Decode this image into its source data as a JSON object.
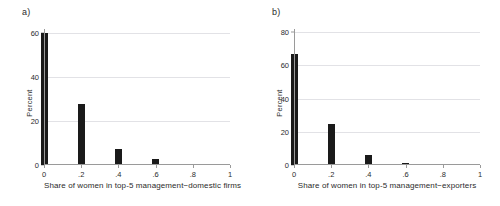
{
  "figure": {
    "background": "#ffffff",
    "bar_color": "#1a1a1a",
    "grid_color": "#e2e2e6",
    "axis_color": "#9a9a9a"
  },
  "chart_data": [
    {
      "type": "bar",
      "panel": "a)",
      "title": "",
      "xlabel": "Share of women in top-5 management−domestic firms",
      "ylabel": "Percent",
      "categories": [
        "0",
        ".2",
        ".4",
        ".6",
        ".8",
        "1"
      ],
      "x": [
        0,
        0.2,
        0.4,
        0.6,
        0.8,
        1
      ],
      "values": [
        60.2,
        27.8,
        7.2,
        2.8,
        0.6,
        0
      ],
      "xtick_labels": [
        "0",
        ".2",
        ".4",
        ".6",
        ".8",
        "1"
      ],
      "ytick_labels": [
        "0",
        "20",
        "40",
        "60"
      ],
      "yticks": [
        0,
        20,
        40,
        60
      ],
      "xlim": [
        0,
        1
      ],
      "ylim": [
        0,
        62
      ],
      "grid": "horizontal",
      "legend": "none"
    },
    {
      "type": "bar",
      "panel": "b)",
      "title": "",
      "xlabel": "Share of women in top-5 management−exporters",
      "ylabel": "Percent",
      "categories": [
        "0",
        ".2",
        ".4",
        ".6",
        ".8",
        "1"
      ],
      "x": [
        0,
        0.2,
        0.4,
        0.6,
        0.8,
        1
      ],
      "values": [
        67.0,
        24.8,
        6.0,
        1.2,
        0,
        0
      ],
      "xtick_labels": [
        "0",
        ".2",
        ".4",
        ".6",
        ".8",
        "1"
      ],
      "ytick_labels": [
        "0",
        "20",
        "40",
        "60",
        "80"
      ],
      "yticks": [
        0,
        20,
        40,
        60,
        80
      ],
      "xlim": [
        0,
        1
      ],
      "ylim": [
        0,
        82
      ],
      "grid": "horizontal",
      "legend": "none"
    }
  ]
}
